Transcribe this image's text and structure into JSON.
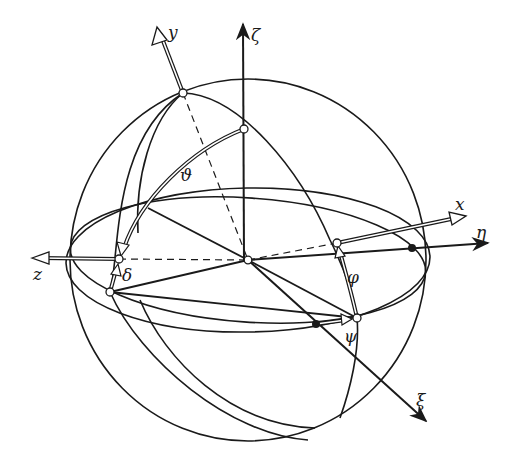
{
  "figure": {
    "colors": {
      "ink": "#1a1a1a",
      "background": "#ffffff"
    },
    "axes": {
      "zeta": "ζ",
      "y": "y",
      "x": "x",
      "eta": "η",
      "z": "z",
      "xi": "ξ"
    },
    "angles": {
      "theta": "ϑ",
      "delta": "δ",
      "phi": "φ",
      "psi": "ψ"
    }
  }
}
